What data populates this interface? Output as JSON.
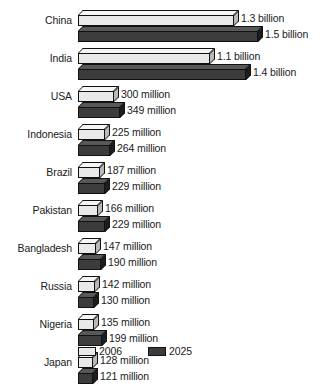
{
  "chart_data": {
    "type": "bar",
    "orientation": "horizontal",
    "title": "",
    "subtitle": "",
    "xlabel": "",
    "ylabel": "",
    "grid": false,
    "legend_position": "bottom-left",
    "units": "population",
    "categories": [
      "China",
      "India",
      "USA",
      "Indonesia",
      "Brazil",
      "Pakistan",
      "Bangladesh",
      "Russia",
      "Nigeria",
      "Japan"
    ],
    "series": [
      {
        "name": "2006",
        "color": "#e9e9e9",
        "values": [
          1300,
          1100,
          300,
          225,
          187,
          166,
          147,
          142,
          135,
          128
        ],
        "labels": [
          "1.3 billion",
          "1.1 billion",
          "300 million",
          "225 million",
          "187 million",
          "166 million",
          "147 million",
          "142 million",
          "135 million",
          "128 million"
        ]
      },
      {
        "name": "2025",
        "color": "#3c3c3c",
        "values": [
          1500,
          1400,
          349,
          264,
          229,
          229,
          190,
          130,
          199,
          121
        ],
        "labels": [
          "1.5 billion",
          "1.4 billion",
          "349 million",
          "264 million",
          "229 million",
          "229 million",
          "190 million",
          "130 million",
          "199 million",
          "121 million"
        ]
      }
    ],
    "xlim": [
      0,
      1500
    ]
  },
  "legend": {
    "items": [
      {
        "label": "2006",
        "swatch": "light-swatch-icon"
      },
      {
        "label": "2025",
        "swatch": "dark-swatch-icon"
      }
    ]
  }
}
